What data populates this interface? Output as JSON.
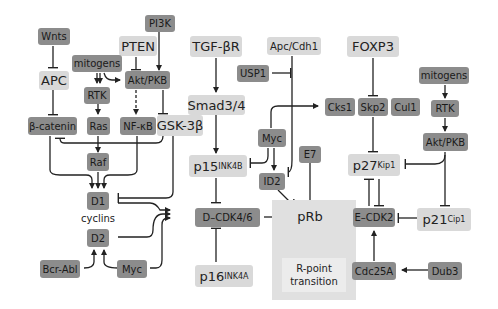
{
  "diagram": {
    "colors": {
      "dark_node": "#8c8c8c",
      "light_node": "#d9d9d9",
      "rpoint_box": "#e0e0e0",
      "line": "#222222"
    },
    "nodes": {
      "wnts": "Wnts",
      "pi3k": "PI3K",
      "pten": "PTEN",
      "apc": "APC",
      "mitogens_left": "mitogens",
      "akt_left": "Akt/PKB",
      "rtk_left": "RTK",
      "beta_catenin": "β-catenin",
      "ras": "Ras",
      "nfkb": "NF-κB",
      "gsk3b": "GSK-3β",
      "raf": "Raf",
      "d1": "D1",
      "cyclins": "cyclins",
      "d2": "D2",
      "bcr_abl": "Bcr-Abl",
      "myc_bottom": "Myc",
      "tgfbr": "TGF-βR",
      "smad": "Smad3/4",
      "p15_base": "p15",
      "p15_sup": "INK4B",
      "dcdk": "D–CDK4/6",
      "p16_base": "p16",
      "p16_sup": "INK4A",
      "apc_cdh1": "Apc/Cdh1",
      "usp1": "USP1",
      "myc_mid": "Myc",
      "id2": "ID2",
      "e7": "E7",
      "prb": "pRb",
      "rpoint_line1": "R-point",
      "rpoint_line2": "transition",
      "foxp3": "FOXP3",
      "cks1": "Cks1",
      "skp2": "Skp2",
      "cul1": "Cul1",
      "p27_base": "p27",
      "p27_sup": "Kip1",
      "ecdk2": "E–CDK2",
      "p21_base": "p21",
      "p21_sup": "Cip1",
      "cdc25a": "Cdc25A",
      "dub3": "Dub3",
      "mitogens_right": "mitogens",
      "rtk_right": "RTK",
      "akt_right": "Akt/PKB"
    }
  }
}
